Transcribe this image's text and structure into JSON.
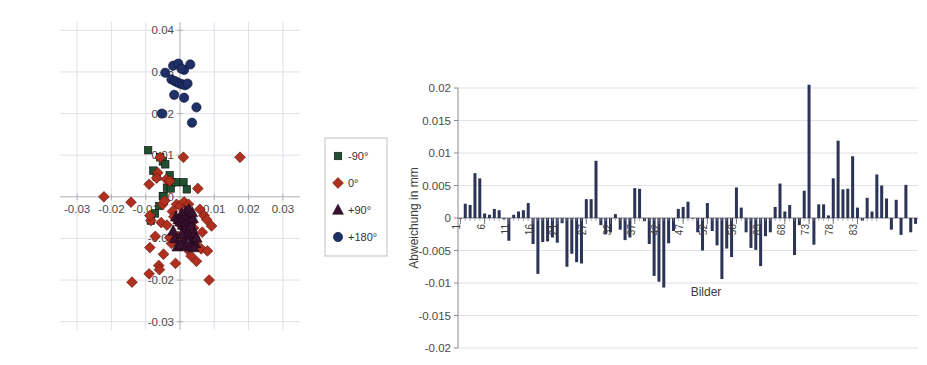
{
  "figure": {
    "background": "#ffffff",
    "panels": [
      "scatter-plot",
      "bar-chart"
    ]
  },
  "chart_data": [
    {
      "type": "scatter",
      "id": "scatter-plot",
      "title": "",
      "xlabel": "",
      "ylabel": "",
      "xlim": [
        -0.035,
        0.035
      ],
      "ylim": [
        -0.032,
        0.042
      ],
      "xticks": [
        "-0.03",
        "-0.02",
        "-0.01",
        "0.01",
        "0.02",
        "0.03"
      ],
      "xtick_values": [
        -0.03,
        -0.02,
        -0.01,
        0.01,
        0.02,
        0.03
      ],
      "yticks": [
        "0.04",
        "0.03",
        "0.02",
        "0.01",
        "0",
        "-0.01",
        "-0.02",
        "-0.03"
      ],
      "ytick_values": [
        0.04,
        0.03,
        0.02,
        0.01,
        0,
        -0.01,
        -0.02,
        -0.03
      ],
      "grid": true,
      "legend_position": "right",
      "legend": [
        {
          "label": "-90°",
          "marker": "square",
          "color": "#1f5130"
        },
        {
          "label": "0°",
          "marker": "diamond",
          "color": "#b0301f"
        },
        {
          "label": "+90°",
          "marker": "triangle",
          "color": "#3a1030"
        },
        {
          "label": "+180°",
          "marker": "circle",
          "color": "#1f2f68"
        }
      ],
      "series": [
        {
          "name": "-90°",
          "marker": "square",
          "color": "#1f5130",
          "points": [
            [
              -0.0093,
              0.0112
            ],
            [
              -0.0078,
              0.0063
            ],
            [
              -0.0058,
              0.0095
            ],
            [
              -0.0068,
              0.0048
            ],
            [
              -0.005,
              0.0085
            ],
            [
              -0.0043,
              0.0078
            ],
            [
              -0.003,
              0.0052
            ],
            [
              -0.0023,
              0.0035
            ],
            [
              -0.0038,
              0.0022
            ],
            [
              -0.0027,
              0.002
            ],
            [
              -0.0013,
              0.0035
            ],
            [
              0.001,
              0.0035
            ],
            [
              -0.005,
              0.0002
            ],
            [
              -0.0073,
              -0.004
            ],
            [
              -0.0085,
              -0.0057
            ],
            [
              -0.006,
              -0.0022
            ],
            [
              -0.0048,
              0.0001
            ],
            [
              0.002,
              0.0018
            ]
          ]
        },
        {
          "name": "0°",
          "marker": "diamond",
          "color": "#b0301f",
          "points": [
            [
              0.0175,
              0.0095
            ],
            [
              -0.0222,
              0.0
            ],
            [
              -0.0143,
              -0.0013
            ],
            [
              -0.014,
              -0.0205
            ],
            [
              -0.009,
              -0.0185
            ],
            [
              -0.0088,
              -0.0122
            ],
            [
              -0.0085,
              -0.0057
            ],
            [
              -0.0088,
              -0.0045
            ],
            [
              -0.009,
              0.003
            ],
            [
              -0.0072,
              -0.0095
            ],
            [
              -0.0065,
              0.0058
            ],
            [
              -0.0062,
              -0.0165
            ],
            [
              -0.006,
              -0.0175
            ],
            [
              -0.0058,
              0.0095
            ],
            [
              -0.0055,
              -0.0062
            ],
            [
              -0.005,
              -0.0018
            ],
            [
              -0.0048,
              -0.0138
            ],
            [
              -0.0045,
              -0.001
            ],
            [
              -0.004,
              0.0042
            ],
            [
              -0.0038,
              -0.0068
            ],
            [
              -0.003,
              -0.0098
            ],
            [
              -0.0025,
              -0.0112
            ],
            [
              -0.0022,
              -0.0035
            ],
            [
              -0.0018,
              -0.0048
            ],
            [
              -0.0013,
              -0.016
            ],
            [
              -0.001,
              -0.0018
            ],
            [
              -0.0005,
              -0.0095
            ],
            [
              0.0,
              -0.0022
            ],
            [
              0.0005,
              -0.007
            ],
            [
              0.001,
              0.0095
            ],
            [
              0.0012,
              -0.0012
            ],
            [
              0.0015,
              -0.009
            ],
            [
              0.002,
              -0.0125
            ],
            [
              0.0025,
              -0.0018
            ],
            [
              0.0032,
              -0.0142
            ],
            [
              0.0035,
              -0.0062
            ],
            [
              0.004,
              -0.0075
            ],
            [
              0.0048,
              -0.0108
            ],
            [
              0.0052,
              0.002
            ],
            [
              0.0058,
              -0.003
            ],
            [
              0.0062,
              -0.0125
            ],
            [
              0.0065,
              -0.0085
            ],
            [
              0.007,
              -0.0045
            ],
            [
              0.0078,
              -0.0055
            ],
            [
              0.008,
              -0.013
            ],
            [
              0.0085,
              -0.02
            ],
            [
              0.0092,
              -0.007
            ],
            [
              0.0048,
              -0.0155
            ],
            [
              -0.0068,
              0.0045
            ],
            [
              -0.003,
              0.0038
            ]
          ]
        },
        {
          "name": "+90°",
          "marker": "triangle",
          "color": "#3a1030",
          "points": [
            [
              -0.0012,
              -0.0048
            ],
            [
              -0.0005,
              -0.0055
            ],
            [
              0.0,
              -0.006
            ],
            [
              0.0005,
              -0.004
            ],
            [
              0.0008,
              -0.0068
            ],
            [
              0.0012,
              -0.005
            ],
            [
              0.0015,
              -0.0078
            ],
            [
              0.0018,
              -0.0062
            ],
            [
              0.0022,
              -0.0045
            ],
            [
              0.0025,
              -0.0085
            ],
            [
              0.0028,
              -0.0058
            ],
            [
              0.003,
              -0.0095
            ],
            [
              0.0033,
              -0.007
            ],
            [
              0.0036,
              -0.0105
            ],
            [
              0.0038,
              -0.0052
            ],
            [
              0.0042,
              -0.0088
            ],
            [
              0.0045,
              -0.0112
            ],
            [
              0.001,
              -0.0108
            ],
            [
              -0.0015,
              -0.01
            ],
            [
              -0.0008,
              -0.012
            ],
            [
              0.0002,
              -0.0115
            ],
            [
              0.002,
              -0.0118
            ],
            [
              0.003,
              -0.012
            ],
            [
              0.004,
              -0.0122
            ],
            [
              0.0048,
              -0.0098
            ],
            [
              -0.002,
              -0.0082
            ],
            [
              0.0005,
              -0.009
            ],
            [
              0.0016,
              -0.0035
            ],
            [
              0.0026,
              -0.003
            ],
            [
              0.0036,
              -0.0038
            ]
          ]
        },
        {
          "name": "+180°",
          "marker": "circle",
          "color": "#1f2f68",
          "points": [
            [
              -0.002,
              0.0315
            ],
            [
              -0.0005,
              0.032
            ],
            [
              0.0012,
              0.0305
            ],
            [
              0.003,
              0.0318
            ],
            [
              -0.0043,
              0.0298
            ],
            [
              -0.0025,
              0.0282
            ],
            [
              -0.0015,
              0.0278
            ],
            [
              -0.0008,
              0.0275
            ],
            [
              0.0,
              0.0272
            ],
            [
              0.0008,
              0.027
            ],
            [
              0.0015,
              0.0268
            ],
            [
              0.0022,
              0.0272
            ],
            [
              0.0004,
              0.0308
            ],
            [
              -0.0017,
              0.0245
            ],
            [
              0.0012,
              0.0238
            ],
            [
              0.0048,
              0.0215
            ],
            [
              -0.0053,
              0.02
            ],
            [
              0.0035,
              0.0178
            ]
          ]
        }
      ]
    },
    {
      "type": "bar",
      "id": "bar-chart",
      "title": "",
      "xlabel": "Bilder",
      "ylabel": "Abweichung in mm",
      "ylim": [
        -0.02,
        0.02
      ],
      "yticks": [
        "0.02",
        "0.015",
        "0.01",
        "0.005",
        "0",
        "-0.005",
        "-0.01",
        "-0.015",
        "-0.02"
      ],
      "ytick_values": [
        0.02,
        0.015,
        0.01,
        0.005,
        0,
        -0.005,
        -0.01,
        -0.015,
        -0.02
      ],
      "xticks": [
        "1",
        "6",
        "11",
        "16",
        "21",
        "27",
        "32",
        "37",
        "42",
        "47",
        "52",
        "58",
        "63",
        "68",
        "73",
        "78",
        "83"
      ],
      "xtick_positions": [
        1,
        6,
        11,
        16,
        21,
        27,
        32,
        37,
        42,
        47,
        52,
        58,
        63,
        68,
        73,
        78,
        83
      ],
      "grid": true,
      "bar_color": "#2b3356",
      "categories": [
        1,
        2,
        3,
        4,
        5,
        6,
        7,
        8,
        9,
        10,
        11,
        12,
        13,
        14,
        15,
        16,
        17,
        18,
        19,
        20,
        21,
        22,
        23,
        24,
        25,
        26,
        27,
        28,
        29,
        30,
        31,
        32,
        33,
        34,
        35,
        36,
        37,
        38,
        39,
        40,
        41,
        42,
        43,
        44,
        45,
        46,
        47,
        48,
        49,
        50,
        51,
        52,
        53,
        54,
        55,
        56,
        57,
        58,
        59,
        60,
        61,
        62,
        63,
        64,
        65,
        66,
        67,
        68,
        69,
        70,
        71,
        72,
        73,
        74,
        75,
        76,
        77,
        78,
        79,
        80,
        81,
        82,
        83,
        84,
        85,
        86,
        87
      ],
      "values": [
        -0.0001,
        0.0022,
        0.002,
        0.0069,
        0.0061,
        0.0007,
        0.0005,
        0.0014,
        0.0012,
        -0.0002,
        -0.0035,
        0.0005,
        0.001,
        0.0012,
        0.0023,
        -0.004,
        -0.0086,
        -0.0037,
        -0.0036,
        -0.003,
        -0.0038,
        -0.0008,
        -0.0075,
        -0.0055,
        -0.0068,
        -0.007,
        0.0029,
        0.0029,
        0.0088,
        -0.0011,
        -0.0025,
        -0.0022,
        0.0006,
        -0.0018,
        -0.0034,
        -0.003,
        0.0046,
        0.0045,
        -0.0005,
        -0.004,
        -0.0089,
        -0.0098,
        -0.0107,
        -0.0039,
        -0.002,
        0.0014,
        0.0017,
        0.0025,
        -0.0001,
        -0.0022,
        -0.005,
        0.0023,
        -0.002,
        -0.0042,
        -0.0094,
        -0.0047,
        -0.006,
        0.0047,
        0.0016,
        -0.0022,
        -0.0046,
        -0.0049,
        -0.0074,
        -0.0028,
        -0.0022,
        0.0017,
        0.0053,
        0.001,
        0.002,
        -0.0057,
        -0.0011,
        0.0042,
        0.0205,
        -0.0041,
        0.0021,
        0.0021,
        0.0004,
        0.0061,
        0.0119,
        0.0044,
        0.0045,
        0.0095,
        0.0016,
        -0.0004,
        0.0031,
        0.001,
        0.0067,
        0.005,
        0.003,
        -0.0018,
        0.0028,
        -0.0026,
        0.0051,
        -0.0022,
        -0.0009
      ]
    }
  ]
}
